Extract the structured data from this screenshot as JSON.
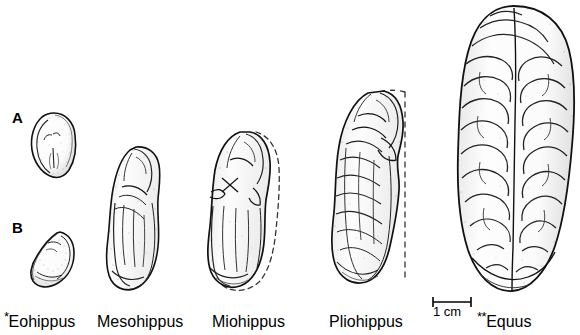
{
  "figure": {
    "background_color": "#ffffff",
    "ink_color": "#000000",
    "width": 580,
    "height": 335
  },
  "panels": [
    {
      "id": "A",
      "letter": "A",
      "view": "dorsal",
      "x": 12,
      "y": 110
    },
    {
      "id": "B",
      "letter": "B",
      "view": "lateral",
      "x": 12,
      "y": 220
    }
  ],
  "scalebar": {
    "caption": "1 cm",
    "length_cm": 1,
    "x": 431,
    "y": 296,
    "width": 40,
    "caption_x": 433,
    "caption_y": 305
  },
  "taxa": [
    {
      "name": "Eohippus",
      "marker": "*",
      "label_x": 4,
      "label_y": 310,
      "specimen_x": 24,
      "specimen_y": 110,
      "specimen_w": 56,
      "specimen_h": 182,
      "dashed_outline": false,
      "relative_size": 0.18
    },
    {
      "name": "Mesohippus",
      "marker": "",
      "label_x": 97,
      "label_y": 310,
      "specimen_x": 104,
      "specimen_y": 145,
      "specimen_w": 68,
      "specimen_h": 148,
      "dashed_outline": false,
      "relative_size": 0.38
    },
    {
      "name": "Miohippus",
      "marker": "",
      "label_x": 212,
      "label_y": 310,
      "specimen_x": 203,
      "specimen_y": 128,
      "specimen_w": 88,
      "specimen_h": 165,
      "dashed_outline": true,
      "relative_size": 0.46
    },
    {
      "name": "Pliohippus",
      "marker": "",
      "label_x": 329,
      "label_y": 310,
      "specimen_x": 328,
      "specimen_y": 88,
      "specimen_w": 98,
      "specimen_h": 205,
      "dashed_outline": true,
      "relative_size": 0.68
    },
    {
      "name": "Equus",
      "marker": "**",
      "label_x": 477,
      "label_y": 310,
      "specimen_x": 452,
      "specimen_y": 4,
      "specimen_w": 126,
      "specimen_h": 289,
      "dashed_outline": false,
      "relative_size": 1.0
    }
  ]
}
